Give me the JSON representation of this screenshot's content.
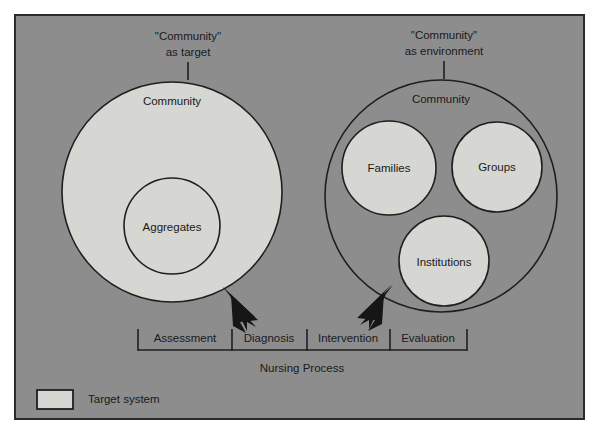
{
  "figure": {
    "background_color": "#8d8d8d",
    "fill_color": "#d6d6d2",
    "line_color": "#1f1f1f",
    "left_panel": {
      "caption_line1": "\"Community\"",
      "caption_line2": "as target",
      "outer_label": "Community",
      "inner_label": "Aggregates"
    },
    "right_panel": {
      "caption_line1": "\"Community\"",
      "caption_line2": "as environment",
      "outer_label": "Community",
      "inner_labels": [
        "Families",
        "Groups",
        "Institutions"
      ]
    },
    "process_bar": {
      "title": "Nursing Process",
      "steps": [
        "Assessment",
        "Diagnosis",
        "Intervention",
        "Evaluation"
      ]
    },
    "legend": {
      "swatch_label": "Target system"
    }
  }
}
